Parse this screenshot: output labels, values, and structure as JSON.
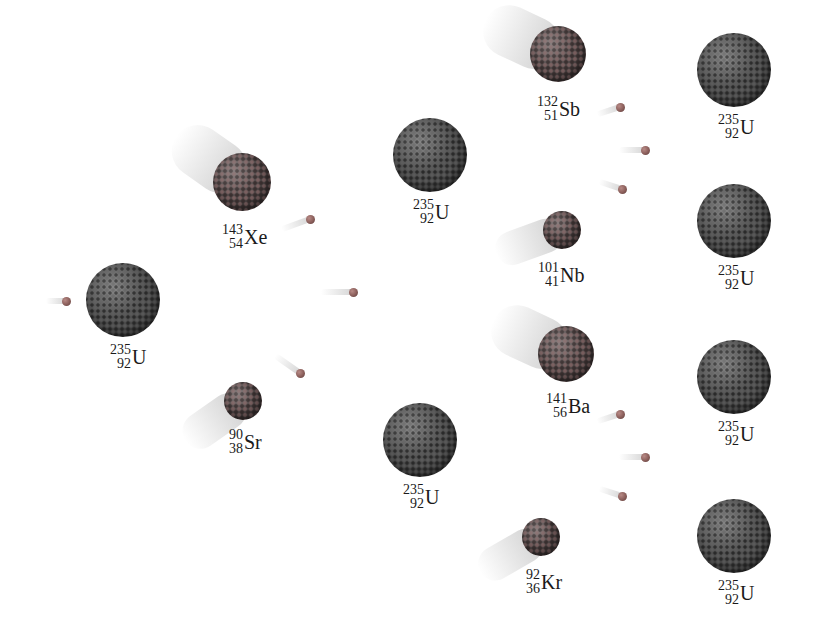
{
  "diagram": {
    "title": "",
    "nuclei": [
      {
        "id": "u-initial",
        "mass": "235",
        "atomic": "92",
        "symbol": "U",
        "x": 123,
        "y": 300,
        "r": 37,
        "kind": "target"
      },
      {
        "id": "xe-143",
        "mass": "143",
        "atomic": "54",
        "symbol": "Xe",
        "x": 242,
        "y": 182,
        "r": 29,
        "kind": "fragment"
      },
      {
        "id": "sr-90",
        "mass": "90",
        "atomic": "38",
        "symbol": "Sr",
        "x": 243,
        "y": 401,
        "r": 19,
        "kind": "fragment"
      },
      {
        "id": "u-mid-top",
        "mass": "235",
        "atomic": "92",
        "symbol": "U",
        "x": 430,
        "y": 155,
        "r": 37,
        "kind": "target"
      },
      {
        "id": "u-mid-bottom",
        "mass": "235",
        "atomic": "92",
        "symbol": "U",
        "x": 420,
        "y": 440,
        "r": 37,
        "kind": "target"
      },
      {
        "id": "sb-132",
        "mass": "132",
        "atomic": "51",
        "symbol": "Sb",
        "x": 558,
        "y": 54,
        "r": 28,
        "kind": "fragment"
      },
      {
        "id": "nb-101",
        "mass": "101",
        "atomic": "41",
        "symbol": "Nb",
        "x": 562,
        "y": 230,
        "r": 19,
        "kind": "fragment"
      },
      {
        "id": "ba-141",
        "mass": "141",
        "atomic": "56",
        "symbol": "Ba",
        "x": 566,
        "y": 354,
        "r": 28,
        "kind": "fragment"
      },
      {
        "id": "kr-92",
        "mass": "92",
        "atomic": "36",
        "symbol": "Kr",
        "x": 541,
        "y": 537,
        "r": 19,
        "kind": "fragment"
      },
      {
        "id": "u-right-1",
        "mass": "235",
        "atomic": "92",
        "symbol": "U",
        "x": 734,
        "y": 70,
        "r": 37,
        "kind": "target"
      },
      {
        "id": "u-right-2",
        "mass": "235",
        "atomic": "92",
        "symbol": "U",
        "x": 734,
        "y": 221,
        "r": 37,
        "kind": "target"
      },
      {
        "id": "u-right-3",
        "mass": "235",
        "atomic": "92",
        "symbol": "U",
        "x": 734,
        "y": 377,
        "r": 37,
        "kind": "target"
      },
      {
        "id": "u-right-4",
        "mass": "235",
        "atomic": "92",
        "symbol": "U",
        "x": 734,
        "y": 536,
        "r": 37,
        "kind": "target"
      }
    ],
    "neutrons": [
      {
        "id": "n-incoming",
        "x": 66,
        "y": 301,
        "trail_len": 20,
        "angle": 0
      },
      {
        "id": "n-1a",
        "x": 310,
        "y": 219,
        "trail_len": 30,
        "angle": -20
      },
      {
        "id": "n-1b",
        "x": 353,
        "y": 292,
        "trail_len": 32,
        "angle": 0
      },
      {
        "id": "n-1c",
        "x": 300,
        "y": 373,
        "trail_len": 30,
        "angle": 35
      },
      {
        "id": "n-2a",
        "x": 620,
        "y": 107,
        "trail_len": 24,
        "angle": -18
      },
      {
        "id": "n-2b",
        "x": 645,
        "y": 150,
        "trail_len": 26,
        "angle": 0
      },
      {
        "id": "n-2c",
        "x": 622,
        "y": 189,
        "trail_len": 24,
        "angle": 18
      },
      {
        "id": "n-3a",
        "x": 620,
        "y": 414,
        "trail_len": 24,
        "angle": -18
      },
      {
        "id": "n-3b",
        "x": 645,
        "y": 457,
        "trail_len": 26,
        "angle": 0
      },
      {
        "id": "n-3c",
        "x": 622,
        "y": 496,
        "trail_len": 24,
        "angle": 18
      }
    ],
    "motion_blurs": [
      {
        "for": "xe-143",
        "x": 242,
        "y": 182,
        "len": 80,
        "thick": 52,
        "angle": 35
      },
      {
        "for": "sr-90",
        "x": 243,
        "y": 401,
        "len": 70,
        "thick": 36,
        "angle": -35
      },
      {
        "for": "sb-132",
        "x": 558,
        "y": 54,
        "len": 80,
        "thick": 52,
        "angle": 25
      },
      {
        "for": "nb-101",
        "x": 562,
        "y": 230,
        "len": 70,
        "thick": 34,
        "angle": -20
      },
      {
        "for": "ba-141",
        "x": 566,
        "y": 354,
        "len": 80,
        "thick": 52,
        "angle": 25
      },
      {
        "for": "kr-92",
        "x": 541,
        "y": 537,
        "len": 70,
        "thick": 34,
        "angle": -30
      }
    ],
    "labels": {
      "u_initial": {
        "mass": "235",
        "atomic": "92",
        "symbol": "U"
      },
      "xe": {
        "mass": "143",
        "atomic": "54",
        "symbol": "Xe"
      },
      "sr": {
        "mass": "90",
        "atomic": "38",
        "symbol": "Sr"
      },
      "u_mid_top": {
        "mass": "235",
        "atomic": "92",
        "symbol": "U"
      },
      "u_mid_bottom": {
        "mass": "235",
        "atomic": "92",
        "symbol": "U"
      },
      "sb": {
        "mass": "132",
        "atomic": "51",
        "symbol": "Sb"
      },
      "nb": {
        "mass": "101",
        "atomic": "41",
        "symbol": "Nb"
      },
      "ba": {
        "mass": "141",
        "atomic": "56",
        "symbol": "Ba"
      },
      "kr": {
        "mass": "92",
        "atomic": "36",
        "symbol": "Kr"
      },
      "u_right_1": {
        "mass": "235",
        "atomic": "92",
        "symbol": "U"
      },
      "u_right_2": {
        "mass": "235",
        "atomic": "92",
        "symbol": "U"
      },
      "u_right_3": {
        "mass": "235",
        "atomic": "92",
        "symbol": "U"
      },
      "u_right_4": {
        "mass": "235",
        "atomic": "92",
        "symbol": "U"
      }
    },
    "colors": {
      "background": "#ffffff",
      "nucleus": "#4a4a4a",
      "fragment": "#4d4444",
      "neutron": "#8a5e5a",
      "label": "#1a1a1a"
    }
  }
}
